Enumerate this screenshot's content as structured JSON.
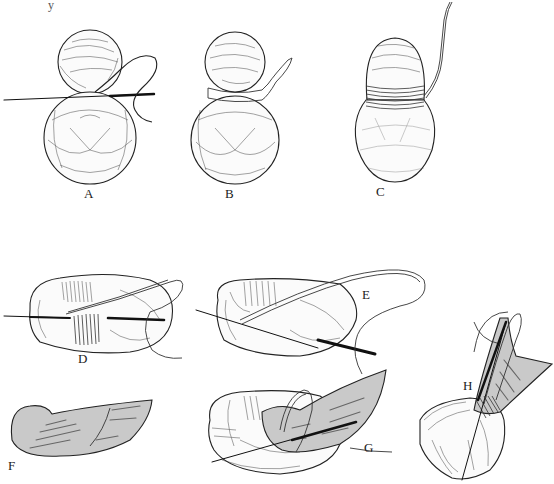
{
  "figure": {
    "corner_text": "y",
    "colors": {
      "background": "#ffffff",
      "ink": "#222222",
      "feather_fill": "#c9c9c9"
    },
    "panels": [
      {
        "id": "A",
        "label": "A",
        "description": "two yarn balls bound with needle and thread"
      },
      {
        "id": "B",
        "label": "B",
        "description": "two yarn balls with ribbon tie"
      },
      {
        "id": "C",
        "label": "C",
        "description": "balls wrapped with thread at waist"
      },
      {
        "id": "D",
        "label": "D",
        "description": "horizontal form pierced by needle with thread wrap"
      },
      {
        "id": "E",
        "label": "E",
        "description": "form with needle and thread loop"
      },
      {
        "id": "F",
        "label": "F",
        "description": "gray feather shape"
      },
      {
        "id": "G",
        "label": "G",
        "description": "feather attached to form with needle"
      },
      {
        "id": "H",
        "label": "H",
        "description": "feather sewn upright onto form"
      }
    ]
  }
}
